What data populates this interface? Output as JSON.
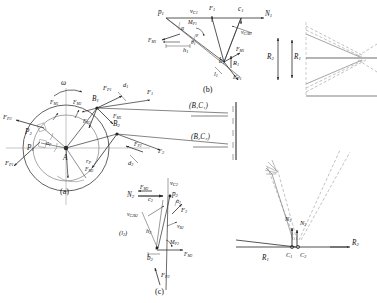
{
  "figure": {
    "panels": [
      {
        "id": "a",
        "caption": "(a)",
        "description": "rotating disc with radial force vectors"
      },
      {
        "id": "b",
        "caption": "(b)",
        "description": "upper blade force triangle"
      },
      {
        "id": "c",
        "caption": "(c)",
        "description": "lower blade force triangle"
      }
    ]
  },
  "panel_a": {
    "caption": "(a)",
    "omega": "ω",
    "center_point": "A",
    "radius_label": "r",
    "radius_sub": "P",
    "points": [
      {
        "name": "B",
        "sub": "1",
        "x": 96,
        "y": 101
      },
      {
        "name": "B",
        "sub": "2",
        "x": 116,
        "y": 127
      },
      {
        "name": "P",
        "sub": "1",
        "x": 29,
        "y": 132
      },
      {
        "name": "P",
        "sub": "2",
        "x": 38,
        "y": 113
      },
      {
        "name": "A",
        "sub": "",
        "x": 66,
        "y": 148
      }
    ],
    "angles": [
      "α",
      "α"
    ],
    "forces": [
      {
        "label": "F",
        "sub": "P1",
        "x": 107,
        "y": 92
      },
      {
        "label": "F",
        "sub": "M1",
        "x": 116,
        "y": 114
      },
      {
        "label": "F",
        "sub": "M2",
        "x": 78,
        "y": 103
      },
      {
        "label": "F",
        "sub": "M1",
        "x": 60,
        "y": 103
      },
      {
        "label": "F",
        "sub": "P2",
        "x": 89,
        "y": 122
      },
      {
        "label": "F",
        "sub": "P3",
        "x": 9,
        "y": 118
      },
      {
        "label": "F",
        "sub": "P1",
        "x": 11,
        "y": 160
      },
      {
        "label": "F",
        "sub": "P2",
        "x": 140,
        "y": 152
      },
      {
        "label": "F",
        "sub": "M2",
        "x": 83,
        "y": 166
      },
      {
        "label": "F",
        "sub": "1",
        "x": 148,
        "y": 96
      },
      {
        "label": "F",
        "sub": "2",
        "x": 159,
        "y": 157
      }
    ],
    "distances": [
      {
        "label": "d",
        "sub": "1",
        "x": 126,
        "y": 89
      },
      {
        "label": "d",
        "sub": "2",
        "x": 133,
        "y": 160
      }
    ],
    "connectors": [
      {
        "label": "(B₁C₁)",
        "x": 193,
        "y": 110
      },
      {
        "label": "(B₂C₂)",
        "x": 195,
        "y": 141
      }
    ]
  },
  "panel_b": {
    "caption": "(b)",
    "points": [
      {
        "name": "p",
        "sub": "1"
      },
      {
        "name": "c",
        "sub": "1"
      },
      {
        "name": "b",
        "sub": "1"
      },
      {
        "name": "N",
        "sub": "1"
      }
    ],
    "velocities": [
      {
        "label": "v",
        "sub": "C1",
        "x": 198,
        "y": 13
      },
      {
        "label": "v",
        "sub": "C1B1",
        "x": 239,
        "y": 35
      }
    ],
    "moments": [
      {
        "label": "M",
        "sub": "P1",
        "x": 193,
        "y": 28
      }
    ],
    "forces": [
      {
        "label": "F",
        "sub": "1",
        "x": 214,
        "y": 12
      },
      {
        "label": "F",
        "sub": "M1",
        "x": 155,
        "y": 40
      },
      {
        "label": "F",
        "sub": "M1",
        "x": 237,
        "y": 53
      },
      {
        "label": "F",
        "sub": "P1",
        "x": 236,
        "y": 79
      }
    ],
    "reaction": {
      "label": "R",
      "sub": "1",
      "x": 231,
      "y": 63
    },
    "lengths": [
      {
        "label": "h",
        "sub": "1",
        "x": 189,
        "y": 51
      },
      {
        "label": "l",
        "sub": "1",
        "x": 219,
        "y": 73
      }
    ],
    "angles": [
      "α",
      "θ",
      "ε"
    ]
  },
  "panel_c": {
    "caption": "(c)",
    "points": [
      {
        "name": "p",
        "sub": "2"
      },
      {
        "name": "c",
        "sub": "2"
      },
      {
        "name": "b",
        "sub": "2"
      },
      {
        "name": "N",
        "sub": "2"
      }
    ],
    "velocities": [
      {
        "label": "v",
        "sub": "C2",
        "x": 166,
        "y": 184
      },
      {
        "label": "v",
        "sub": "C2B2",
        "x": 131,
        "y": 216
      },
      {
        "label": "v",
        "sub": "B2",
        "x": 177,
        "y": 230
      }
    ],
    "moments": [
      {
        "label": "M",
        "sub": "P2",
        "x": 172,
        "y": 245
      }
    ],
    "forces": [
      {
        "label": "F",
        "sub": "M2",
        "x": 139,
        "y": 193
      },
      {
        "label": "F",
        "sub": "2",
        "x": 180,
        "y": 213
      },
      {
        "label": "F",
        "sub": "M2",
        "x": 186,
        "y": 258
      },
      {
        "label": "F",
        "sub": "P2",
        "x": 159,
        "y": 276
      }
    ],
    "lengths": [
      {
        "label": "h",
        "sub": "2",
        "x": 148,
        "y": 231
      },
      {
        "label": "(l₂)",
        "x": 124,
        "y": 233
      }
    ],
    "angles": [
      "α"
    ]
  },
  "panel_right": {
    "radii": [
      {
        "label": "R",
        "sub": "2",
        "x": 271,
        "y": 58
      },
      {
        "label": "R",
        "sub": "1",
        "x": 295,
        "y": 58
      },
      {
        "label": "R",
        "sub": "1",
        "x": 268,
        "y": 262
      },
      {
        "label": "R",
        "sub": "2",
        "x": 355,
        "y": 242
      }
    ],
    "nodes": [
      {
        "label": "N",
        "sub": "1",
        "x": 289,
        "y": 222
      },
      {
        "label": "N",
        "sub": "2",
        "x": 302,
        "y": 224
      },
      {
        "label": "C",
        "sub": "1",
        "x": 288,
        "y": 242
      },
      {
        "label": "C",
        "sub": "2",
        "x": 301,
        "y": 242
      }
    ]
  },
  "colors": {
    "line": "#2b2b2b",
    "thin": "#555555",
    "dashed": "#8a8a8a",
    "background": "#ffffff"
  }
}
